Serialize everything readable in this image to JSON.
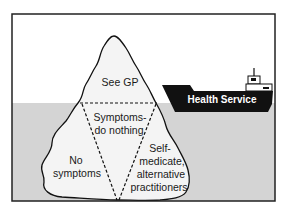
{
  "diagram": {
    "type": "iceberg-metaphor",
    "colors": {
      "sky": "#ffffff",
      "water": "#d4d4d4",
      "iceberg": "#f4f4f4",
      "outline": "#111111",
      "ship_hull": "#111111",
      "ship_text": "#ffffff",
      "frame": "#222222"
    },
    "iceberg": {
      "tip_label": "See GP",
      "center_label_line1": "Symptoms-",
      "center_label_line2": "do nothing",
      "left_label_line1": "No",
      "left_label_line2": "symptoms",
      "right_label_line1": "Self-",
      "right_label_line2": "medicate,",
      "right_label_line3": "alternative",
      "right_label_line4": "practitioners"
    },
    "ship": {
      "label": "Health Service"
    }
  }
}
